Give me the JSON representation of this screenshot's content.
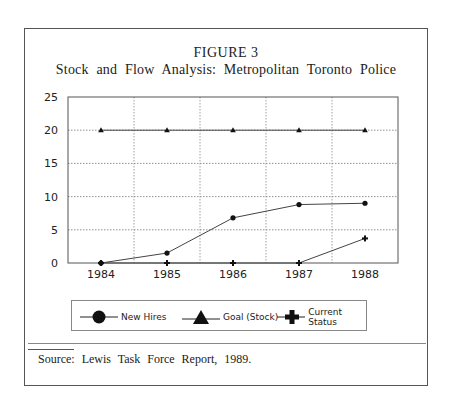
{
  "figure": {
    "number_label": "FIGURE 3",
    "title": "Stock and Flow Analysis: Metropolitan Toronto Police"
  },
  "legend": {
    "items": [
      {
        "label": "New Hires",
        "marker": "circle"
      },
      {
        "label": "Goal (Stock)",
        "marker": "triangle"
      },
      {
        "label": "Current Status",
        "marker": "plus"
      }
    ]
  },
  "source": "Source: Lewis Task Force Report, 1989.",
  "chart_data": {
    "type": "line",
    "title": "Stock and Flow Analysis: Metropolitan Toronto Police",
    "subtitle": "FIGURE 3",
    "xlabel": "",
    "ylabel": "",
    "categories": [
      "1984",
      "1985",
      "1986",
      "1987",
      "1988"
    ],
    "y_ticks": [
      "0",
      "5",
      "10",
      "15",
      "20",
      "25"
    ],
    "ylim": [
      0,
      25
    ],
    "grid": true,
    "legend_position": "bottom",
    "series": [
      {
        "name": "New Hires",
        "marker": "circle",
        "values": [
          0,
          1.5,
          6.8,
          8.8,
          9.0
        ]
      },
      {
        "name": "Goal (Stock)",
        "marker": "triangle",
        "values": [
          20,
          20,
          20,
          20,
          20
        ]
      },
      {
        "name": "Current Status",
        "marker": "plus",
        "values": [
          0,
          0,
          0,
          0,
          3.7
        ]
      }
    ]
  }
}
